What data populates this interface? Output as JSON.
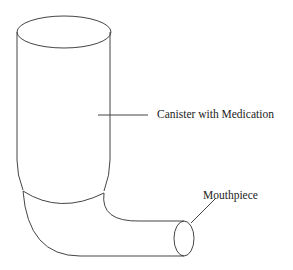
{
  "diagram": {
    "labels": {
      "canister": "Canister with Medication",
      "mouthpiece": "Mouthpiece"
    },
    "stroke_color": "#444444",
    "background": "#ffffff"
  }
}
